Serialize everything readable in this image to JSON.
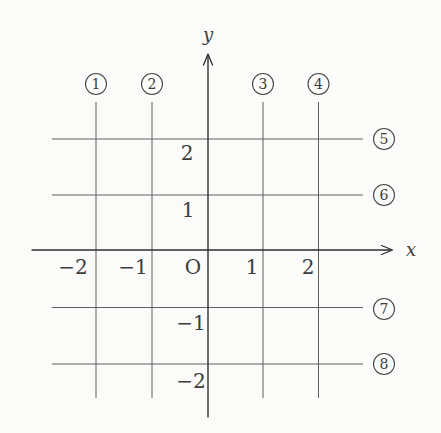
{
  "figure_type": "coordinate-grid-diagram",
  "colors": {
    "background": "#fbfbf9",
    "ink": "#3d3d3d",
    "grid_line": "#5f5f5f",
    "axis_line": "#2e2e2e"
  },
  "axes": {
    "x_label": "x",
    "y_label": "y",
    "origin_label": "O",
    "x_range": [
      -2,
      2
    ],
    "y_range": [
      -2,
      2
    ]
  },
  "vertical_lines": [
    {
      "badge": "1",
      "x_value": -2,
      "tick_label": "−2"
    },
    {
      "badge": "2",
      "x_value": -1,
      "tick_label": "−1"
    },
    {
      "badge": "3",
      "x_value": 1,
      "tick_label": "1"
    },
    {
      "badge": "4",
      "x_value": 2,
      "tick_label": "2"
    }
  ],
  "horizontal_lines": [
    {
      "badge": "5",
      "y_value": 2,
      "tick_label": "2"
    },
    {
      "badge": "6",
      "y_value": 1,
      "tick_label": "1"
    },
    {
      "badge": "7",
      "y_value": -1,
      "tick_label": "−1"
    },
    {
      "badge": "8",
      "y_value": -2,
      "tick_label": "−2"
    }
  ]
}
